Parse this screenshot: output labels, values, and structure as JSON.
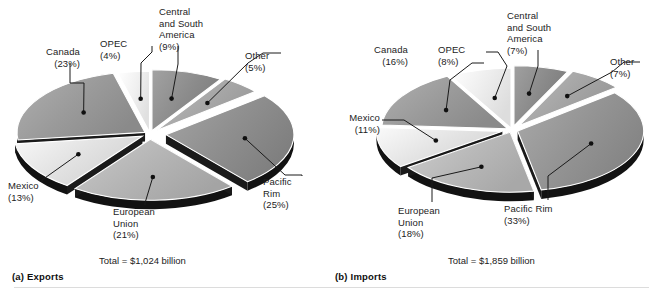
{
  "figure": {
    "background": "#ffffff",
    "text_color": "#1c1c1c",
    "divider_color": "#dcdcdc"
  },
  "panels": [
    {
      "id": "exports",
      "title": "(a)  Exports",
      "total_caption": "Total = $1,024 billion",
      "labels": {
        "canada": "Canada\n(23%)",
        "opec": "OPEC\n(4%)",
        "central_south_america": "Central\nand South\nAmerica\n(9%)",
        "other": "Other\n(5%)",
        "pacific_rim": "Pacific\nRim\n(25%)",
        "european_union": "European\nUnion\n(21%)",
        "mexico": "Mexico\n(13%)"
      }
    },
    {
      "id": "imports",
      "title": "(b)  Imports",
      "total_caption": "Total = $1,859 billion",
      "labels": {
        "canada": "Canada\n(16%)",
        "opec": "OPEC\n(8%)",
        "central_south_america": "Central\nand South\nAmerica\n(7%)",
        "other": "Other\n(7%)",
        "pacific_rim": "Pacific Rim\n(33%)",
        "european_union": "European\nUnion\n(18%)",
        "mexico": "Mexico\n(11%)"
      }
    }
  ],
  "chart_data": [
    {
      "type": "pie",
      "title": "(a)  Exports",
      "subtitle": "Total = $1,024 billion",
      "total_label": "Total = $1,024 billion",
      "total_value": 1024,
      "total_units": "billion US dollars",
      "exploded": true,
      "three_d": true,
      "legend": "none (direct labels with leader lines)",
      "categories": [
        "Canada",
        "OPEC",
        "Central and South America",
        "Other",
        "Pacific Rim",
        "European Union",
        "Mexico"
      ],
      "values": [
        23,
        4,
        9,
        5,
        25,
        21,
        13
      ],
      "value_units": "percent",
      "slices": [
        {
          "label": "Canada",
          "percent": 23,
          "display": "Canada (23%)",
          "fill": "#9a9a9a"
        },
        {
          "label": "OPEC",
          "percent": 4,
          "display": "OPEC (4%)",
          "fill": "#f0f0f0"
        },
        {
          "label": "Central and South America",
          "percent": 9,
          "display": "Central and South America (9%)",
          "fill": "#8c8c8c"
        },
        {
          "label": "Other",
          "percent": 5,
          "display": "Other (5%)",
          "fill": "#a8a8a8"
        },
        {
          "label": "Pacific Rim",
          "percent": 25,
          "display": "Pacific Rim (25%)",
          "fill": "#8f8f8f"
        },
        {
          "label": "European Union",
          "percent": 21,
          "display": "European Union (21%)",
          "fill": "#b4b4b4"
        },
        {
          "label": "Mexico",
          "percent": 13,
          "display": "Mexico (13%)",
          "fill": "#e2e2e2"
        }
      ]
    },
    {
      "type": "pie",
      "title": "(b)  Imports",
      "subtitle": "Total = $1,859 billion",
      "total_label": "Total = $1,859 billion",
      "total_value": 1859,
      "total_units": "billion US dollars",
      "exploded": true,
      "three_d": true,
      "legend": "none (direct labels with leader lines)",
      "categories": [
        "Canada",
        "OPEC",
        "Central and South America",
        "Other",
        "Pacific Rim",
        "European Union",
        "Mexico"
      ],
      "values": [
        16,
        8,
        7,
        7,
        33,
        18,
        11
      ],
      "value_units": "percent",
      "slices": [
        {
          "label": "Canada",
          "percent": 16,
          "display": "Canada (16%)",
          "fill": "#9a9a9a"
        },
        {
          "label": "OPEC",
          "percent": 8,
          "display": "OPEC (8%)",
          "fill": "#ededed"
        },
        {
          "label": "Central and South America",
          "percent": 7,
          "display": "Central and South America (7%)",
          "fill": "#8a8a8a"
        },
        {
          "label": "Other",
          "percent": 7,
          "display": "Other (7%)",
          "fill": "#a6a6a6"
        },
        {
          "label": "Pacific Rim",
          "percent": 33,
          "display": "Pacific Rim (33%)",
          "fill": "#949494"
        },
        {
          "label": "European Union",
          "percent": 18,
          "display": "European Union (18%)",
          "fill": "#b8b8b8"
        },
        {
          "label": "Mexico",
          "percent": 11,
          "display": "Mexico (11%)",
          "fill": "#e4e4e4"
        }
      ]
    }
  ]
}
